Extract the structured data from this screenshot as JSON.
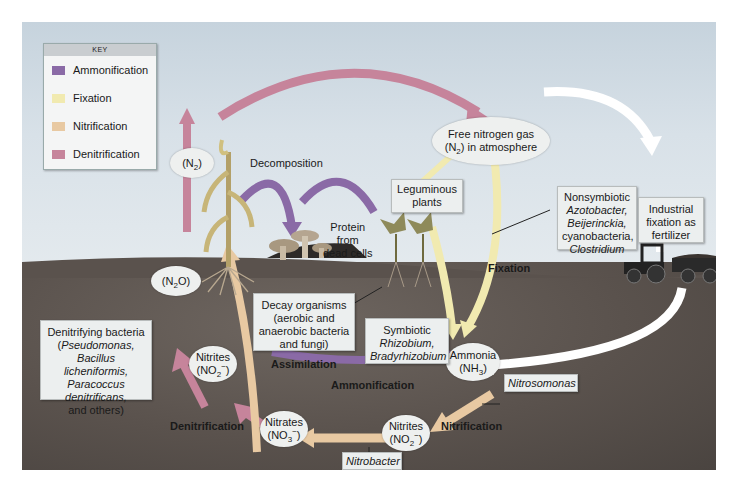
{
  "colors": {
    "ammonification": "#8a6aa6",
    "fixation": "#f1eab0",
    "nitrification": "#e8c9a2",
    "denitrification": "#c6849b",
    "sky": "#d5dee5",
    "soil": "#5a524d",
    "box_fill": "#ecefef"
  },
  "key": {
    "title": "KEY",
    "items": [
      {
        "label": "Ammonification",
        "color": "#8a6aa6"
      },
      {
        "label": "Fixation",
        "color": "#f1eab0"
      },
      {
        "label": "Nitrification",
        "color": "#e8c9a2"
      },
      {
        "label": "Denitrification",
        "color": "#c6849b"
      }
    ]
  },
  "nodes": {
    "n2_top": {
      "pre": "(N",
      "sub": "2",
      "post": ")"
    },
    "free_nitrogen": {
      "line1": "Free nitrogen gas",
      "line2_pre": "(N",
      "line2_sub": "2",
      "line2_post": ") in atmosphere"
    },
    "n2o": {
      "pre": "(N",
      "sub": "2",
      "post": "O)"
    },
    "nitrites_left": {
      "line1": "Nitrites",
      "line2_pre": "(NO",
      "line2_sub": "2",
      "line2_sup": "−",
      "line2_post": ")"
    },
    "nitrates": {
      "line1": "Nitrates",
      "line2_pre": "(NO",
      "line2_sub": "3",
      "line2_sup": "−",
      "line2_post": ")"
    },
    "nitrites_right": {
      "line1": "Nitrites",
      "line2_pre": "(NO",
      "line2_sub": "2",
      "line2_sup": "−",
      "line2_post": ")"
    },
    "ammonia": {
      "line1": "Ammonia",
      "line2_pre": "(NH",
      "line2_sub": "3",
      "line2_post": ")"
    }
  },
  "boxes": {
    "leguminous": {
      "line1": "Leguminous",
      "line2": "plants"
    },
    "nonsymbiotic": {
      "line1": "Nonsymbiotic",
      "line2": "Azotobacter,",
      "line3": "Beijerinckia,",
      "line4": "cyanobacteria,",
      "line5": "Clostridium"
    },
    "industrial": {
      "line1": "Industrial",
      "line2": "fixation as",
      "line3": "fertilizer"
    },
    "decay": {
      "line1": "Decay organisms",
      "line2": "(aerobic and",
      "line3": "anaerobic bacteria",
      "line4": "and fungi)"
    },
    "symbiotic": {
      "line1": "Symbiotic",
      "line2": "Rhizobium,",
      "line3": "Bradyrhizobium"
    },
    "denitrifying": {
      "line1": "Denitrifying bacteria",
      "line2_pre": "(",
      "line2_it": "Pseudomonas,",
      "line3": "Bacillus licheniformis,",
      "line4": "Paracoccus",
      "line5": "denitrificans,",
      "line6": "and others)"
    },
    "nitrosomonas": {
      "label": "Nitrosomonas"
    },
    "nitrobacter": {
      "label": "Nitrobacter"
    }
  },
  "labels": {
    "decomposition": "Decomposition",
    "protein": {
      "line1": "Protein",
      "line2": "from",
      "line3": "dead cells"
    },
    "fixation": "Fixation",
    "assimilation": "Assimilation",
    "ammonification": "Ammonification",
    "denitrification": "Denitrification",
    "nitrification": "Nitrification"
  }
}
